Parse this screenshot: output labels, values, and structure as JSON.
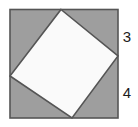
{
  "figure": {
    "outer_square": {
      "name": "outer-square",
      "fill_color": "#9e9e9e",
      "stroke_color": "#555555",
      "stroke_width": 1.6,
      "x": 10,
      "y": 9.5,
      "width": 108,
      "height": 108.5,
      "side_length_px": 108
    },
    "inner_square": {
      "name": "inscribed-tilted-square",
      "fill_color": "#fafafa",
      "stroke_color": "#555555",
      "stroke_width": 1.6,
      "points": "61,9.5 118,56 72,118 10,76",
      "vertices": [
        {
          "label": "top",
          "x": 61,
          "y": 9.5
        },
        {
          "label": "right",
          "x": 118,
          "y": 56
        },
        {
          "label": "bottom",
          "x": 72,
          "y": 118
        },
        {
          "label": "left",
          "x": 10,
          "y": 76
        }
      ]
    },
    "labels": [
      {
        "name": "segment-label-3",
        "text": "3",
        "x": 127,
        "y": 38,
        "describes": "upper segment of right edge"
      },
      {
        "name": "segment-label-4",
        "text": "4",
        "x": 127,
        "y": 94,
        "describes": "lower segment of right edge"
      }
    ]
  },
  "chart_data": {
    "type": "diagram",
    "shapes": [
      {
        "name": "outer-square",
        "kind": "square",
        "fill": "#9e9e9e",
        "stroke": "#555555",
        "side": 108,
        "corners": [
          [
            10,
            9.5
          ],
          [
            118,
            9.5
          ],
          [
            118,
            118
          ],
          [
            10,
            118
          ]
        ]
      },
      {
        "name": "inscribed-tilted-square",
        "kind": "square",
        "fill": "#fafafa",
        "stroke": "#555555",
        "corners": [
          [
            61,
            9.5
          ],
          [
            118,
            56
          ],
          [
            72,
            118
          ],
          [
            10,
            76
          ]
        ]
      }
    ],
    "annotations": [
      {
        "text": "3",
        "x": 127,
        "y": 38
      },
      {
        "text": "4",
        "x": 127,
        "y": 94
      }
    ],
    "measurements": {
      "upper_right_segment": 3,
      "lower_right_segment": 4
    }
  }
}
